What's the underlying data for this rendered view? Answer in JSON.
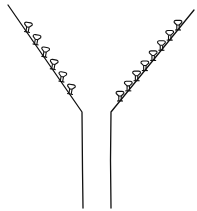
{
  "diagram": {
    "colors": {
      "line": "#111111",
      "background": "#ffffff"
    },
    "left_arm": {
      "start": [
        8,
        5
      ],
      "bend": [
        82,
        112
      ],
      "end": [
        83,
        208
      ],
      "protrusion_count": 6,
      "protrusion_shape": "mushroom",
      "protrusion_orientation": "perpendicular to wall, pointing inward (up-right)"
    },
    "right_arm": {
      "start": [
        194,
        10
      ],
      "bend": [
        111,
        112
      ],
      "end": [
        111,
        208
      ],
      "protrusion_count": 8,
      "protrusion_shape": "mushroom",
      "protrusion_orientation": "upright, cap on top"
    }
  }
}
